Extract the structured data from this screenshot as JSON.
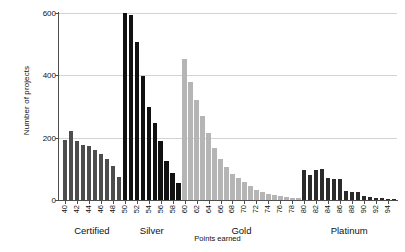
{
  "chart_data": {
    "type": "bar",
    "title": "",
    "xlabel": "Points earned",
    "ylabel": "Number of projects",
    "xlim": [
      39,
      95.5
    ],
    "ylim": [
      0,
      600
    ],
    "yticks": [
      0,
      200,
      400,
      600
    ],
    "xticks": [
      40,
      42,
      44,
      46,
      48,
      50,
      52,
      54,
      56,
      58,
      60,
      62,
      64,
      66,
      68,
      70,
      72,
      74,
      76,
      78,
      80,
      82,
      84,
      86,
      88,
      90,
      92,
      94
    ],
    "grid": "horizontal",
    "legend": "none",
    "x": [
      40,
      41,
      42,
      43,
      44,
      45,
      46,
      47,
      48,
      49,
      50,
      51,
      52,
      53,
      54,
      55,
      56,
      57,
      58,
      59,
      60,
      61,
      62,
      63,
      64,
      65,
      66,
      67,
      68,
      69,
      70,
      71,
      72,
      73,
      74,
      75,
      76,
      77,
      78,
      79,
      80,
      81,
      82,
      83,
      84,
      85,
      86,
      87,
      88,
      89,
      90,
      91,
      92,
      93,
      94,
      95
    ],
    "values": [
      193,
      222,
      190,
      178,
      172,
      160,
      147,
      133,
      110,
      73,
      600,
      593,
      508,
      397,
      300,
      247,
      188,
      125,
      88,
      53,
      452,
      378,
      320,
      268,
      215,
      168,
      133,
      107,
      85,
      70,
      57,
      45,
      33,
      25,
      20,
      15,
      12,
      9,
      7,
      5,
      97,
      80,
      95,
      100,
      70,
      68,
      67,
      30,
      27,
      25,
      12,
      10,
      7,
      5,
      4,
      3
    ],
    "groups": [
      {
        "label": "Certified",
        "start": 40,
        "end": 49,
        "color": "#4d4d4d"
      },
      {
        "label": "Silver",
        "start": 50,
        "end": 59,
        "color": "#111111"
      },
      {
        "label": "Gold",
        "start": 60,
        "end": 79,
        "color": "#b5b5b5"
      },
      {
        "label": "Platinum",
        "start": 80,
        "end": 95,
        "color": "#2b2b2b"
      }
    ],
    "colors": {
      "certified": "#4d4d4d",
      "silver": "#111111",
      "gold": "#b5b5b5",
      "platinum": "#2b2b2b",
      "gridline": "#d3d3d3",
      "axis": "#4d4d4d",
      "text": "#111111",
      "background": "#ffffff"
    }
  }
}
